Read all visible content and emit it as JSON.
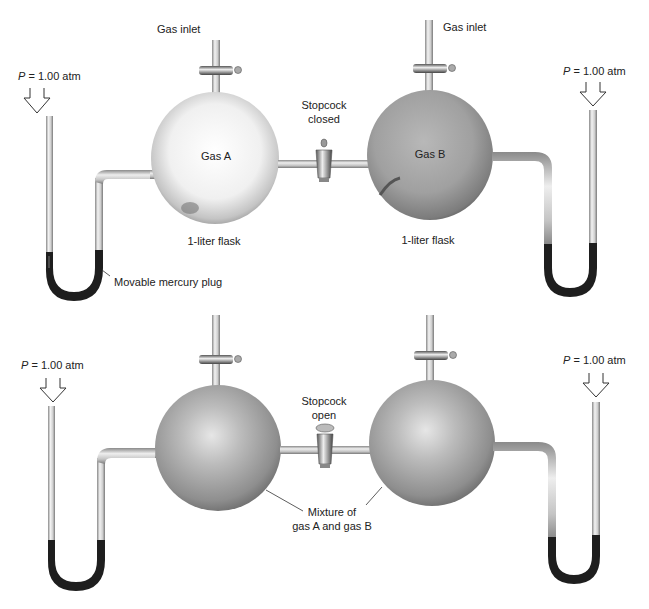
{
  "top_panel": {
    "state": "Stopcock closed",
    "left_pressure": {
      "symbol": "P",
      "text": " = 1.00 atm"
    },
    "right_pressure": {
      "symbol": "P",
      "text": " = 1.00 atm"
    },
    "left_inlet": "Gas inlet",
    "right_inlet": "Gas inlet",
    "flask_a": {
      "label": "Gas A",
      "caption": "1-liter flask"
    },
    "flask_b": {
      "label": "Gas B",
      "caption": "1-liter flask"
    },
    "stopcock": {
      "line1": "Stopcock",
      "line2": "closed"
    },
    "mercury_label": "Movable mercury plug"
  },
  "bottom_panel": {
    "state": "Stopcock open",
    "left_pressure": {
      "symbol": "P",
      "text": " = 1.00 atm"
    },
    "right_pressure": {
      "symbol": "P",
      "text": " = 1.00 atm"
    },
    "stopcock": {
      "line1": "Stopcock",
      "line2": "open"
    },
    "mixture": {
      "line1": "Mixture of",
      "line2": "gas A and gas B"
    }
  },
  "colors": {
    "mercury": "#1e1e1e",
    "flask_a": "#e8e8e8",
    "flask_b": "#9a9a9a",
    "mixed": "#a8a8a8",
    "glass": "#c8c8c8"
  }
}
